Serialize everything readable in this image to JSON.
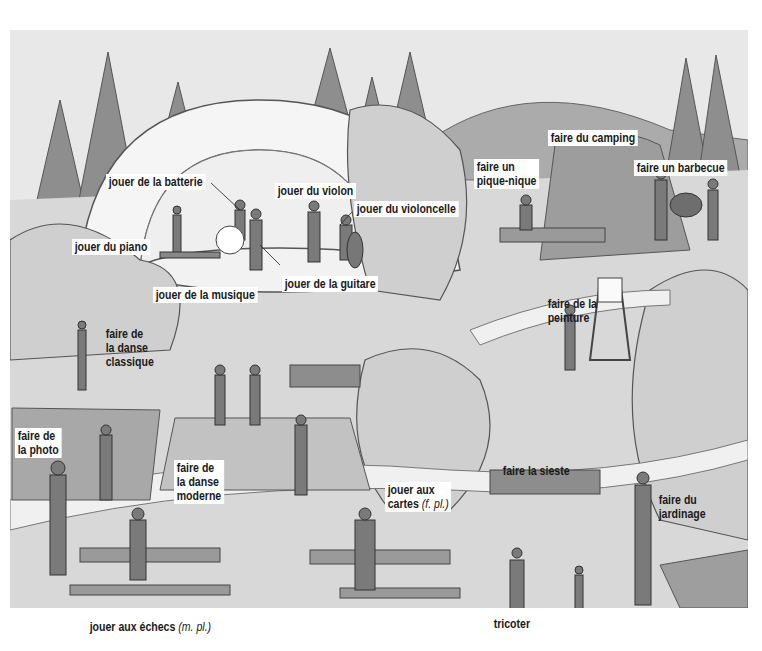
{
  "illustration": {
    "type": "vocabulary-scene",
    "style": "grayscale pencil illustration of a park with bandstand",
    "labels": {
      "faire_du_camping": "faire du camping",
      "faire_un_pique_nique": "faire un pique-nique",
      "faire_un_barbecue": "faire un barbecue",
      "jouer_de_la_batterie": "jouer de la batterie",
      "jouer_du_violon": "jouer du violon",
      "jouer_du_violoncelle": "jouer du violoncelle",
      "jouer_du_piano": "jouer du piano",
      "jouer_de_la_guitare": "jouer de la guitare",
      "jouer_de_la_musique": "jouer de la musique",
      "faire_de_la_danse_classique": "faire de la danse classique",
      "faire_de_la_peinture": "faire de la peinture",
      "faire_de_la_photo": "faire de la photo",
      "faire_de_la_danse_moderne": "faire de la danse moderne",
      "faire_la_sieste": "faire la sieste",
      "jouer_aux_cartes": "jouer aux cartes",
      "jouer_aux_cartes_gloss": "(f. pl.)",
      "faire_du_jardinage": "faire du jardinage",
      "jouer_aux_echecs": "jouer aux échecs",
      "jouer_aux_echecs_gloss": "(m. pl.)",
      "tricoter": "tricoter"
    },
    "label_lines": {
      "pique_nique_1": "faire un",
      "pique_nique_2": "pique-nique",
      "danse_classique_1": "faire de",
      "danse_classique_2": "la danse",
      "danse_classique_3": "classique",
      "peinture_1": "faire de la",
      "peinture_2": "peinture",
      "photo_1": "faire de",
      "photo_2": "la photo",
      "danse_moderne_1": "faire de",
      "danse_moderne_2": "la danse",
      "danse_moderne_3": "moderne",
      "cartes_1": "jouer aux",
      "cartes_2": "cartes",
      "jardinage_1": "faire du",
      "jardinage_2": "jardinage"
    },
    "colors": {
      "sky": "#e8e8e8",
      "hill": "#a9a9a9",
      "tree_dark": "#8c8c8c",
      "tree_light": "#cfcfcf",
      "ground": "#d6d6d6",
      "path": "#ececec",
      "bandstand": "#f4f4f4",
      "label_bg": "#ffffff",
      "label_text": "#1a1a1a"
    }
  }
}
